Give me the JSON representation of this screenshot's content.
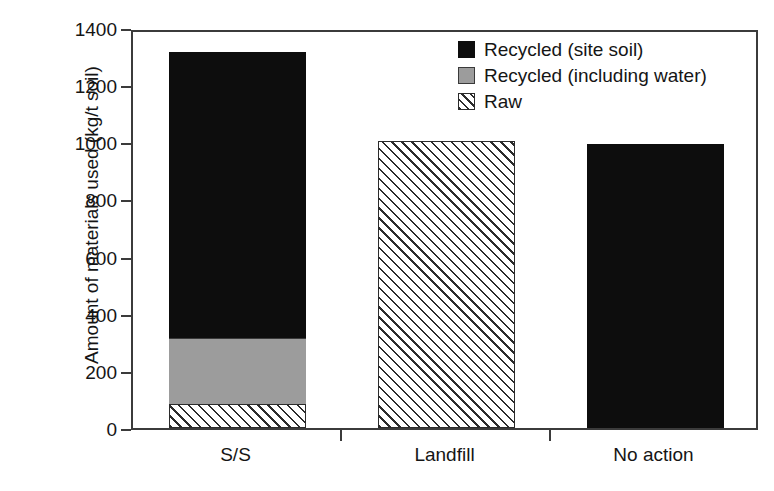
{
  "chart_data": {
    "type": "bar",
    "subtype": "stacked-vertical",
    "title": "",
    "xlabel": "",
    "ylabel": "Amount of materials used (kg/t soil)",
    "categories": [
      "S/S",
      "Landfill",
      "No action"
    ],
    "ylim": [
      0,
      1400
    ],
    "yticks": [
      0,
      200,
      400,
      600,
      800,
      1000,
      1200,
      1400
    ],
    "ytick_labels": [
      "0",
      "200",
      "400",
      "600",
      "800",
      "1000",
      "1200",
      "1400"
    ],
    "grid": false,
    "legend_position": "top-right-inside",
    "series": [
      {
        "name": "Raw",
        "style": "hatched-diagonal",
        "color": "#ffffff",
        "values": [
          85,
          1005,
          0
        ]
      },
      {
        "name": "Recycled (including water)",
        "style": "solid",
        "color": "#9c9c9c",
        "values": [
          230,
          0,
          0
        ]
      },
      {
        "name": "Recycled (site soil)",
        "style": "solid",
        "color": "#0d0d0d",
        "values": [
          1000,
          0,
          995
        ]
      }
    ],
    "stack_order_bottom_to_top": [
      "Raw",
      "Recycled (including water)",
      "Recycled (site soil)"
    ],
    "totals": [
      1315,
      1005,
      995
    ],
    "units": "kg/t soil"
  },
  "legend": {
    "items": [
      {
        "label": "Recycled (site soil)",
        "swatch": "black-square-icon"
      },
      {
        "label": "Recycled (including water)",
        "swatch": "gray-square-icon"
      },
      {
        "label": "Raw",
        "swatch": "hatched-square-icon"
      }
    ]
  },
  "axis": {
    "y_title": "Amount of materials used (kg/t soil)",
    "y_tick_labels": [
      "1400",
      "1200",
      "1000",
      "800",
      "600",
      "400",
      "200",
      "0"
    ],
    "x_tick_labels": [
      "S/S",
      "Landfill",
      "No action"
    ]
  }
}
